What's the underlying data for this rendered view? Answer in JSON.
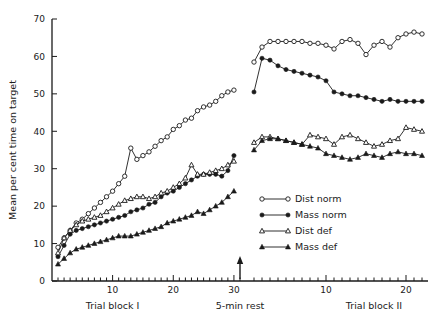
{
  "chart_data": {
    "type": "line",
    "title": "",
    "xlabel": "",
    "ylabel": "Mean per cent time on target",
    "ylim": [
      0,
      70
    ],
    "yticks": [
      0,
      10,
      20,
      30,
      40,
      50,
      60,
      70
    ],
    "grid": false,
    "legend_position": "center-right",
    "annotations": [
      {
        "text": "Trial block I",
        "x": 10,
        "axis": "block1"
      },
      {
        "text": "5-min rest",
        "x": 30,
        "axis": "block1"
      },
      {
        "text": "Trial block II",
        "x": 16,
        "axis": "block2"
      }
    ],
    "x_axis_block1": {
      "label": "Trial block I",
      "ticks": [
        10,
        20,
        30
      ],
      "range": [
        1,
        31
      ]
    },
    "x_axis_block2": {
      "label": "Trial block II",
      "ticks": [
        10,
        20
      ],
      "range": [
        1,
        20
      ]
    },
    "rest_marker": {
      "label": "5-min rest",
      "at_x": 30
    },
    "series": [
      {
        "name": "Dist norm",
        "marker": "open-circle",
        "block1": [
          9.0,
          11.5,
          13.5,
          15.5,
          16.5,
          18.0,
          19.5,
          21.0,
          22.5,
          24.0,
          26.0,
          28.0,
          35.5,
          32.5,
          33.5,
          34.5,
          36.0,
          37.5,
          38.5,
          40.5,
          41.5,
          43.0,
          43.5,
          45.5,
          46.5,
          47.0,
          48.0,
          49.5,
          50.5,
          51.0
        ],
        "block2": [
          58.5,
          62.5,
          64.0,
          64.0,
          64.0,
          64.0,
          64.0,
          63.5,
          63.5,
          63.0,
          62.0,
          64.0,
          64.5,
          63.5,
          60.5,
          63.0,
          64.0,
          62.5,
          65.0,
          66.0,
          66.5,
          66.0
        ]
      },
      {
        "name": "Mass norm",
        "marker": "filled-circle",
        "block1": [
          6.5,
          9.5,
          12.5,
          13.5,
          14.0,
          14.5,
          15.0,
          15.5,
          16.0,
          16.5,
          17.0,
          17.5,
          18.5,
          19.0,
          19.5,
          20.5,
          21.0,
          22.5,
          23.5,
          24.0,
          25.0,
          26.0,
          27.0,
          28.0,
          28.5,
          28.5,
          28.5,
          28.0,
          29.5,
          33.5
        ],
        "block2": [
          50.5,
          59.5,
          59.0,
          57.5,
          56.5,
          56.0,
          55.5,
          55.0,
          54.5,
          53.5,
          50.5,
          50.0,
          49.5,
          49.5,
          49.0,
          48.5,
          48.0,
          48.5,
          48.0,
          48.0,
          48.0,
          48.0
        ]
      },
      {
        "name": "Dist def",
        "marker": "open-triangle",
        "block1": [
          7.5,
          11.5,
          13.5,
          15.0,
          16.0,
          16.5,
          17.0,
          17.5,
          18.5,
          19.5,
          20.5,
          21.5,
          22.0,
          22.5,
          22.5,
          22.0,
          22.5,
          23.5,
          24.0,
          25.0,
          26.0,
          27.5,
          31.0,
          28.5,
          28.5,
          29.0,
          29.5,
          30.0,
          31.0,
          32.0
        ],
        "block2": [
          37.0,
          38.5,
          38.5,
          38.0,
          37.5,
          37.0,
          36.5,
          39.0,
          38.5,
          38.0,
          36.5,
          38.5,
          39.0,
          38.0,
          37.0,
          36.0,
          36.5,
          37.5,
          38.0,
          41.0,
          40.5,
          40.0
        ]
      },
      {
        "name": "Mass def",
        "marker": "filled-triangle",
        "block1": [
          4.5,
          6.0,
          7.5,
          8.5,
          9.0,
          9.5,
          10.0,
          10.5,
          11.0,
          11.5,
          12.0,
          12.0,
          12.0,
          12.5,
          13.0,
          13.5,
          14.0,
          14.5,
          15.5,
          16.0,
          16.5,
          17.0,
          17.5,
          18.5,
          18.0,
          19.0,
          20.0,
          21.0,
          22.5,
          24.0
        ],
        "block2": [
          35.0,
          37.5,
          38.0,
          38.0,
          37.5,
          37.0,
          36.5,
          36.0,
          35.5,
          34.0,
          33.5,
          33.0,
          32.5,
          33.0,
          34.0,
          33.5,
          33.0,
          34.0,
          34.5,
          34.0,
          34.0,
          33.5
        ]
      }
    ]
  },
  "legend": {
    "items": [
      {
        "label": "Dist norm"
      },
      {
        "label": "Mass norm"
      },
      {
        "label": "Dist def"
      },
      {
        "label": "Mass def"
      }
    ]
  },
  "ytick_labels": [
    "0",
    "10",
    "20",
    "30",
    "40",
    "50",
    "60",
    "70"
  ],
  "xtick_labels_block1": [
    "10",
    "20",
    "30"
  ],
  "xtick_labels_block2": [
    "10",
    "20"
  ]
}
